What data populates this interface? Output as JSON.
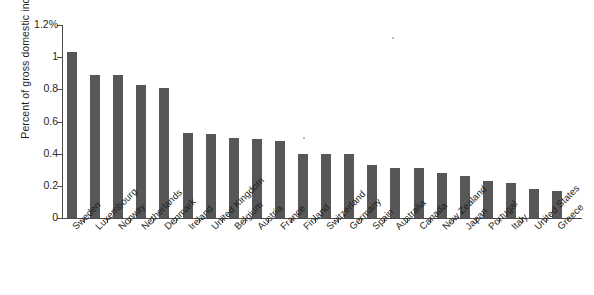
{
  "chart_data": {
    "type": "bar",
    "title": "",
    "xlabel": "",
    "ylabel": "Percent of gross domestic income",
    "ylim": [
      0,
      1.2
    ],
    "y_tick_labels": [
      "0",
      "0.2",
      "0.4",
      "0.6",
      "0.8",
      "1",
      "1.2%"
    ],
    "y_ticks": [
      0,
      0.2,
      0.4,
      0.6,
      0.8,
      1,
      1.2
    ],
    "grid": false,
    "legend": "none",
    "categories": [
      "Sweden",
      "Luxembourg",
      "Norway",
      "Netherlands",
      "Denmark",
      "Ireland",
      "United Kingdom",
      "Belgium",
      "Austria",
      "France",
      "Finland",
      "Switzerland",
      "Germany",
      "Spain",
      "Australia",
      "Canada",
      "New Zealand",
      "Japan",
      "Portugal",
      "Italy",
      "United States",
      "Greece"
    ],
    "values": [
      1.03,
      0.89,
      0.89,
      0.83,
      0.81,
      0.53,
      0.52,
      0.5,
      0.49,
      0.48,
      0.4,
      0.4,
      0.4,
      0.33,
      0.31,
      0.31,
      0.28,
      0.26,
      0.23,
      0.22,
      0.18,
      0.17
    ],
    "bar_color": "#575757",
    "axis_color": "#4a4a4a"
  }
}
